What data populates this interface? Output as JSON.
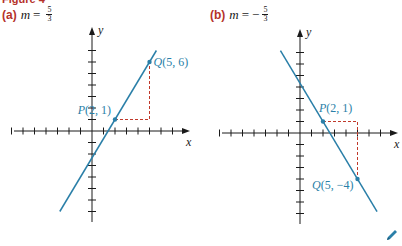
{
  "figure": {
    "title": "Figure 4",
    "edit_icon": "pencil-icon"
  },
  "colors": {
    "line": "#2a7fa8",
    "label": "#2a7fa8",
    "dashed": "#c0392b",
    "axis": "#1a1a1a",
    "panel_label": "#b5322a"
  },
  "panels": [
    {
      "label": "(a)",
      "slope_var": "m",
      "slope_sign": "",
      "slope_num": "5",
      "slope_den": "3"
    },
    {
      "label": "(b)",
      "slope_var": "m",
      "slope_sign": "−",
      "slope_num": "5",
      "slope_den": "3"
    }
  ],
  "chart_data": [
    {
      "type": "line",
      "title": "(a) m = 5/3",
      "xlabel": "x",
      "ylabel": "y",
      "xlim": [
        -7,
        7.5
      ],
      "ylim": [
        -7.5,
        8
      ],
      "grid": false,
      "x_ticks": [
        -7,
        -6,
        -5,
        -4,
        -3,
        -2,
        -1,
        1,
        2,
        3,
        4,
        5,
        6,
        7
      ],
      "y_ticks": [
        -7,
        -6,
        -5,
        -4,
        -3,
        -2,
        -1,
        1,
        2,
        3,
        4,
        5,
        6,
        7
      ],
      "series": [
        {
          "name": "line",
          "slope": 1.6667,
          "intercept": -2.3333,
          "x": [
            -2.8,
            5.6
          ]
        }
      ],
      "points": [
        {
          "name": "P",
          "label": "P(2, 1)",
          "x": 2,
          "y": 1,
          "label_pos": "upper-left"
        },
        {
          "name": "Q",
          "label": "Q(5, 6)",
          "x": 5,
          "y": 6,
          "label_pos": "right"
        }
      ],
      "rise_run": {
        "corner": [
          5,
          1
        ]
      }
    },
    {
      "type": "line",
      "title": "(b) m = −5/3",
      "xlabel": "x",
      "ylabel": "y",
      "xlim": [
        -7,
        7.5
      ],
      "ylim": [
        -7.5,
        8
      ],
      "grid": false,
      "x_ticks": [
        -7,
        -6,
        -5,
        -4,
        -3,
        -2,
        -1,
        1,
        2,
        3,
        4,
        5,
        6,
        7
      ],
      "y_ticks": [
        -7,
        -6,
        -5,
        -4,
        -3,
        -2,
        -1,
        1,
        2,
        3,
        4,
        5,
        6,
        7
      ],
      "series": [
        {
          "name": "line",
          "slope": -1.6667,
          "intercept": 4.3333,
          "x": [
            -1.7,
            6.7
          ]
        }
      ],
      "points": [
        {
          "name": "P",
          "label": "P(2, 1)",
          "x": 2,
          "y": 1,
          "label_pos": "upper-right"
        },
        {
          "name": "Q",
          "label": "Q(5, −4)",
          "x": 5,
          "y": -4,
          "label_pos": "left"
        }
      ],
      "rise_run": {
        "corner": [
          5,
          1
        ]
      }
    }
  ]
}
